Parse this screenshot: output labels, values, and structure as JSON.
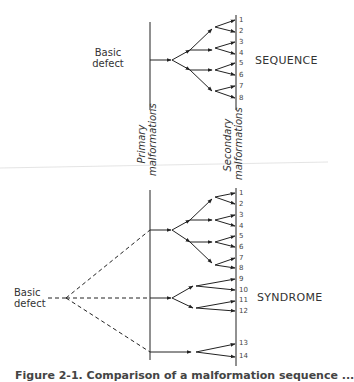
{
  "diagram": {
    "top": {
      "origin_label": [
        "Basic",
        "defect"
      ],
      "group_label": "SEQUENCE",
      "outcomes": [
        "1",
        "2",
        "3",
        "4",
        "5",
        "6",
        "7",
        "8"
      ]
    },
    "bottom": {
      "origin_label": [
        "Basic",
        "defect"
      ],
      "group_label": "SYNDROME",
      "outcomes": [
        "1",
        "2",
        "3",
        "4",
        "5",
        "6",
        "7",
        "8",
        "9",
        "10",
        "11",
        "12",
        "13",
        "14"
      ]
    },
    "axis_labels": {
      "primary": [
        "Primary",
        "malformations"
      ],
      "secondary": [
        "Secondary",
        "malformations"
      ]
    },
    "caption": "Figure 2-1. Comparison of a malformation sequence ..."
  }
}
